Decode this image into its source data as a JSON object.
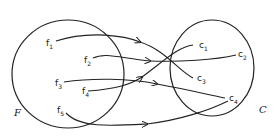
{
  "diagram": {
    "type": "function-mapping",
    "domain_set": {
      "label": "F",
      "elements": [
        {
          "base": "f",
          "sub": "1"
        },
        {
          "base": "f",
          "sub": "2"
        },
        {
          "base": "f",
          "sub": "3"
        },
        {
          "base": "f",
          "sub": "4"
        },
        {
          "base": "f",
          "sub": "5"
        }
      ]
    },
    "codomain_set": {
      "label": "C",
      "elements": [
        {
          "base": "c",
          "sub": "1"
        },
        {
          "base": "c",
          "sub": "2"
        },
        {
          "base": "c",
          "sub": "3"
        },
        {
          "base": "c",
          "sub": "4"
        }
      ]
    },
    "mappings": [
      {
        "from": "f1",
        "to": "c3"
      },
      {
        "from": "f2",
        "to": "c2"
      },
      {
        "from": "f3",
        "to": "c4"
      },
      {
        "from": "f4",
        "to": "c1"
      },
      {
        "from": "f5",
        "to": "c4"
      }
    ]
  }
}
